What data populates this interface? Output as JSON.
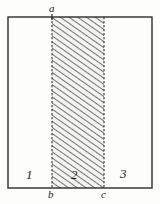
{
  "figure": {
    "background_color": "#fdfdfb",
    "stroke_color": "#2b2b2b",
    "hatch_color": "#5a5a5a",
    "hatch_fill": "#f2f2f0"
  },
  "labels": {
    "vertex_a": "a",
    "vertex_b": "b",
    "vertex_c": "c",
    "region_1": "1",
    "region_2": "2",
    "region_3": "3"
  },
  "geometry": {
    "rect": {
      "x": 8,
      "y": 17,
      "width": 144,
      "height": 171
    },
    "divider_b_x": 52,
    "divider_c_x": 104,
    "point_a_x": 52,
    "hatched_region": {
      "x": 52,
      "width": 52
    }
  }
}
